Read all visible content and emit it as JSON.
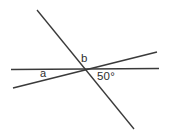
{
  "figure": {
    "width": 171,
    "height": 135,
    "background_color": "#ffffff",
    "line_color": "#3a3a3a",
    "text_color": "#2e2e2e",
    "intersection": {
      "x": 84,
      "y": 69
    },
    "lines": [
      {
        "name": "horizontal-line",
        "x1": 11,
        "y1": 69.5,
        "x2": 159,
        "y2": 68.5
      },
      {
        "name": "steep-descending-line",
        "x1": 37,
        "y1": 10,
        "x2": 134,
        "y2": 129
      },
      {
        "name": "gentle-ascending-line",
        "x1": 13,
        "y1": 88,
        "x2": 157,
        "y2": 52
      }
    ],
    "labels": [
      {
        "name": "angle-a",
        "text": "a"
      },
      {
        "name": "angle-b",
        "text": "b"
      },
      {
        "name": "angle-50",
        "text": "50°"
      }
    ]
  }
}
